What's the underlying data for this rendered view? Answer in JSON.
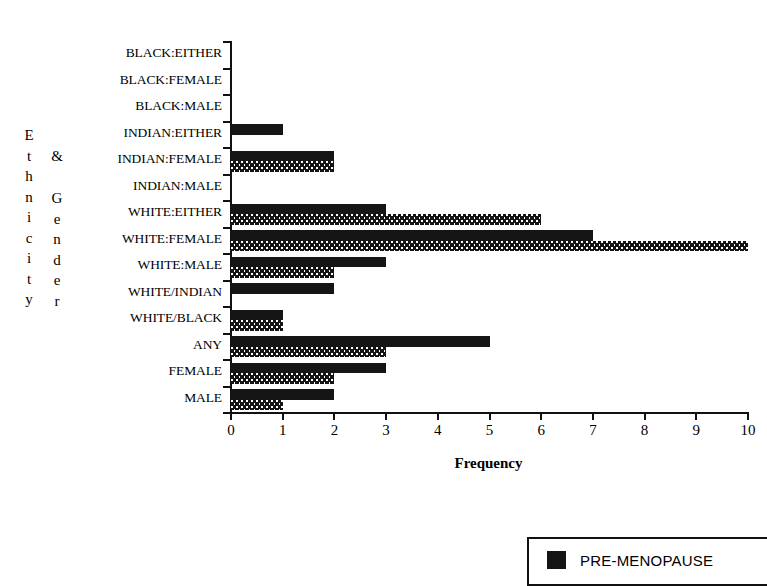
{
  "axis_titles": {
    "y_primary": "Ethnicity",
    "y_connector": "&",
    "y_secondary": "Gender",
    "x_caption": "Frequency"
  },
  "legend": {
    "items": [
      {
        "label": "PRE-MENOPAUSE",
        "swatch": "solid-black-swatch",
        "color": "#141414"
      }
    ]
  },
  "chart_data": {
    "type": "bar",
    "orientation": "horizontal",
    "title": "",
    "subtitle": "",
    "xlabel": "Frequency",
    "ylabel": "Ethnicity & Gender",
    "xlim": [
      0,
      10
    ],
    "xticks": [
      0,
      1,
      2,
      3,
      4,
      5,
      6,
      7,
      8,
      9,
      10
    ],
    "xtick_labels": [
      "0",
      "1",
      "2",
      "3",
      "4",
      "5",
      "6",
      "7",
      "8",
      "9",
      "10"
    ],
    "grid": false,
    "legend_position": "bottom-right",
    "categories": [
      "BLACK:EITHER",
      "BLACK:FEMALE",
      "BLACK:MALE",
      "INDIAN:EITHER",
      "INDIAN:FEMALE",
      "INDIAN:MALE",
      "WHITE:EITHER",
      "WHITE:FEMALE",
      "WHITE:MALE",
      "WHITE/INDIAN",
      "WHITE/BLACK",
      "ANY",
      "FEMALE",
      "MALE"
    ],
    "series": [
      {
        "name": "PRE-MENOPAUSE",
        "fill": "solid",
        "color": "#151515",
        "values": [
          0,
          0,
          0,
          1,
          2,
          0,
          3,
          7,
          3,
          2,
          1,
          5,
          3,
          2
        ]
      },
      {
        "name": "",
        "fill": "dotted",
        "color": "#141414",
        "values": [
          0,
          0,
          0,
          0,
          2,
          0,
          6,
          10,
          2,
          0,
          1,
          3,
          2,
          1
        ]
      }
    ]
  }
}
